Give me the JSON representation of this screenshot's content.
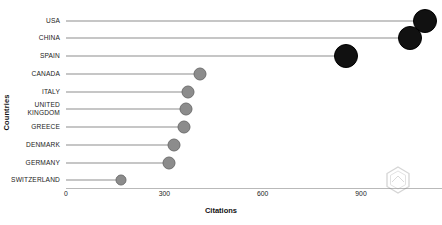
{
  "chart_data": {
    "type": "bar",
    "subtype": "lollipop-horizontal",
    "title": "",
    "xlabel": "Citations",
    "ylabel": "Countries",
    "categories": [
      "USA",
      "CHINA",
      "SPAIN",
      "CANADA",
      "ITALY",
      "UNITED\nKINGDOM",
      "GREECE",
      "DENMARK",
      "GERMANY",
      "SWITZERLAND"
    ],
    "values": [
      1094,
      1050,
      853,
      410,
      372,
      366,
      360,
      329,
      313,
      169
    ],
    "xlim": [
      0,
      1150
    ],
    "xticks": [
      0,
      300,
      600,
      900
    ],
    "xtick_labels": [
      "0",
      "300",
      "600",
      "900"
    ],
    "grid": false,
    "legend": null,
    "marker_sizes": [
      11,
      11,
      11,
      5.5,
      5.5,
      5.5,
      5.5,
      5.5,
      5.5,
      4.5
    ],
    "marker_colors": [
      "#111111",
      "#111111",
      "#111111",
      "#8c8c8c",
      "#8c8c8c",
      "#8c8c8c",
      "#8c8c8c",
      "#8c8c8c",
      "#8c8c8c",
      "#8c8c8c"
    ],
    "stem_color": "#8e8e8e",
    "background": "#ffffff"
  },
  "watermark": {
    "name": "hexagon-logo-watermark"
  }
}
